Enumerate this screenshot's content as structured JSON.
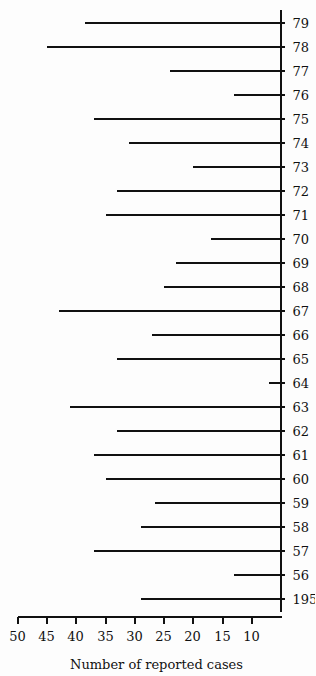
{
  "chart_data": {
    "type": "bar",
    "title": "",
    "xlabel": "",
    "ylabel": "Number of reported cases",
    "orientation_note": "figure printed rotated 90 degrees counterclockwise",
    "categories": [
      "1955",
      "56",
      "57",
      "58",
      "59",
      "60",
      "61",
      "62",
      "63",
      "64",
      "65",
      "66",
      "67",
      "68",
      "69",
      "70",
      "71",
      "72",
      "73",
      "74",
      "75",
      "76",
      "77",
      "78",
      "79"
    ],
    "values": [
      29,
      13,
      37,
      29,
      26.5,
      35,
      37,
      33,
      41,
      7,
      33,
      27,
      43,
      25,
      23,
      17,
      35,
      33,
      20,
      31,
      37,
      13,
      24,
      45,
      38.5
    ],
    "ylim": [
      5,
      50
    ],
    "yticks": [
      10,
      15,
      20,
      25,
      30,
      35,
      40,
      45,
      50
    ],
    "ytick_labels": [
      "10",
      "15",
      "20",
      "25",
      "30",
      "35",
      "40",
      "45",
      "50"
    ],
    "grid": false,
    "legend": null
  }
}
